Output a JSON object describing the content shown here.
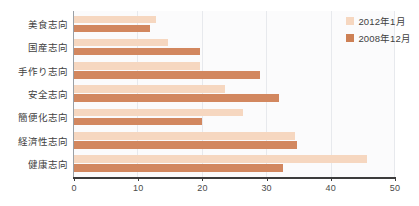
{
  "chart_data": {
    "type": "bar",
    "orientation": "horizontal",
    "title": "",
    "subtitle": "",
    "xlabel": "",
    "ylabel": "",
    "xlim": [
      0,
      50
    ],
    "xticks": [
      0,
      10,
      20,
      30,
      40,
      50
    ],
    "xtick_labels": [
      "0",
      "10",
      "20",
      "30",
      "40",
      "50"
    ],
    "grid": true,
    "grid_axis": "x",
    "legend_position": "top-right",
    "categories": [
      "美食志向",
      "国産志向",
      "手作り志向",
      "安全志向",
      "簡便化志向",
      "経済性志向",
      "健康志向"
    ],
    "series": [
      {
        "name": "2012年1月",
        "color": "#f6d7c0",
        "values": [
          12.8,
          14.6,
          19.7,
          23.5,
          26.3,
          34.5,
          45.6
        ]
      },
      {
        "name": "2008年12月",
        "color": "#d2875f",
        "values": [
          11.8,
          19.7,
          28.9,
          32.0,
          20.0,
          34.7,
          32.6
        ]
      }
    ]
  },
  "legend": {
    "items": [
      {
        "label": "2012年1月",
        "swatch": "light"
      },
      {
        "label": "2008年12月",
        "swatch": "dark"
      }
    ]
  }
}
